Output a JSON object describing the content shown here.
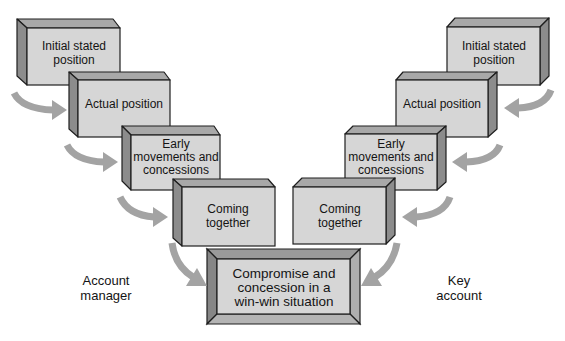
{
  "diagram": {
    "left_party": {
      "line1": "Account",
      "line2": "manager"
    },
    "right_party": {
      "line1": "Key",
      "line2": "account"
    },
    "left_steps": [
      {
        "lines": [
          "Initial stated",
          "position"
        ]
      },
      {
        "lines": [
          "Actual position"
        ]
      },
      {
        "lines": [
          "Early",
          "movements and",
          "concessions"
        ]
      },
      {
        "lines": [
          "Coming",
          "together"
        ]
      }
    ],
    "right_steps": [
      {
        "lines": [
          "Initial stated",
          "position"
        ]
      },
      {
        "lines": [
          "Actual position"
        ]
      },
      {
        "lines": [
          "Early",
          "movements and",
          "concessions"
        ]
      },
      {
        "lines": [
          "Coming",
          "together"
        ]
      }
    ],
    "outcome": {
      "lines": [
        "Compromise and",
        "concession in a",
        "win-win situation"
      ]
    },
    "colors": {
      "box_front": "#d6d6d6",
      "box_top": "#a8a8a8",
      "box_side": "#8c8c8c",
      "arrow": "#a3a3a3",
      "outline": "#1e1e1e"
    }
  }
}
